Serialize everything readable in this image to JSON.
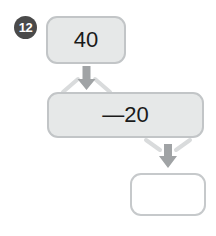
{
  "problem": {
    "number": "12",
    "type": "function-machine-flow"
  },
  "diagram": {
    "nodes": [
      {
        "id": "input",
        "label": "40",
        "role": "starting-value",
        "filled": true,
        "fill_color": "#e6e8e8",
        "border_color": "#c2c5c7"
      },
      {
        "id": "operation",
        "label": "—20",
        "role": "operation",
        "filled": true,
        "fill_color": "#e6e8e8",
        "border_color": "#c2c5c7"
      },
      {
        "id": "result",
        "label": "",
        "role": "answer-blank",
        "filled": false,
        "fill_color": "#ffffff",
        "border_color": "#c6c9cb"
      }
    ],
    "arrows": [
      {
        "id": "arrow-input-to-operation",
        "from": "input",
        "to": "operation",
        "direction": "down",
        "color": "#a0a3a5"
      },
      {
        "id": "arrow-operation-to-result",
        "from": "operation",
        "to": "result",
        "direction": "down",
        "color": "#a0a3a5"
      }
    ],
    "badge_color": "#4a4a4a",
    "badge_text_color": "#ffffff"
  }
}
